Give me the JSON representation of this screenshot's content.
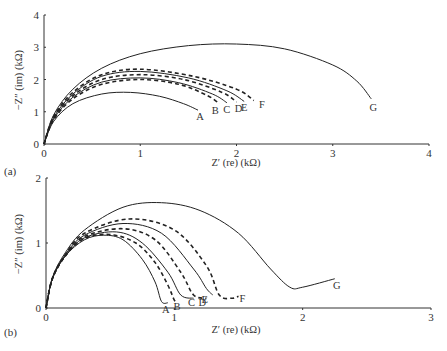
{
  "chart_data": [
    {
      "panel": "(a)",
      "type": "line",
      "title": "",
      "xlabel": "Z′ (re) (kΩ)",
      "ylabel": "−Z″ (im) (kΩ)",
      "xlim": [
        0,
        4
      ],
      "ylim": [
        0,
        4
      ],
      "xticks": [
        "0",
        "1",
        "2",
        "3",
        "4"
      ],
      "yticks": [
        "0",
        "1",
        "2",
        "3",
        "4"
      ],
      "grid": false,
      "legend": "inline curve labels",
      "series": [
        {
          "name": "A",
          "style": "solid",
          "x": [
            0,
            0.1,
            0.3,
            0.6,
            0.9,
            1.2,
            1.45,
            1.6
          ],
          "y": [
            0,
            0.7,
            1.25,
            1.55,
            1.6,
            1.48,
            1.25,
            1.05
          ]
        },
        {
          "name": "B",
          "style": "dashed",
          "x": [
            0,
            0.1,
            0.3,
            0.6,
            1.0,
            1.4,
            1.7,
            1.82
          ],
          "y": [
            0,
            0.75,
            1.4,
            1.85,
            2.0,
            1.85,
            1.5,
            1.25
          ]
        },
        {
          "name": "C",
          "style": "solid",
          "x": [
            0,
            0.1,
            0.3,
            0.6,
            1.0,
            1.4,
            1.75,
            1.9
          ],
          "y": [
            0,
            0.77,
            1.45,
            1.92,
            2.05,
            1.9,
            1.55,
            1.28
          ]
        },
        {
          "name": "D",
          "style": "dashed",
          "x": [
            0,
            0.1,
            0.3,
            0.6,
            1.0,
            1.45,
            1.85,
            2.0
          ],
          "y": [
            0,
            0.8,
            1.5,
            2.0,
            2.15,
            2.0,
            1.6,
            1.3
          ]
        },
        {
          "name": "E",
          "style": "solid",
          "x": [
            0,
            0.1,
            0.3,
            0.6,
            1.0,
            1.5,
            1.9,
            2.08
          ],
          "y": [
            0,
            0.82,
            1.55,
            2.1,
            2.25,
            2.05,
            1.65,
            1.32
          ]
        },
        {
          "name": "F",
          "style": "dashed",
          "x": [
            0,
            0.1,
            0.3,
            0.6,
            1.0,
            1.55,
            2.0,
            2.18
          ],
          "y": [
            0,
            0.85,
            1.6,
            2.15,
            2.32,
            2.1,
            1.7,
            1.35
          ]
        },
        {
          "name": "G",
          "style": "solid",
          "x": [
            0,
            0.1,
            0.3,
            0.6,
            1.0,
            1.5,
            2.0,
            2.5,
            3.0,
            3.25,
            3.4
          ],
          "y": [
            0,
            0.9,
            1.7,
            2.35,
            2.8,
            3.05,
            3.1,
            2.95,
            2.45,
            1.95,
            1.4
          ]
        }
      ]
    },
    {
      "panel": "(b)",
      "type": "line",
      "title": "",
      "xlabel": "Z′ (re) (kΩ)",
      "ylabel": "−Z″ (im) (kΩ)",
      "xlim": [
        0,
        3
      ],
      "ylim": [
        0,
        2
      ],
      "xticks": [
        "0",
        "1",
        "2",
        "3"
      ],
      "yticks": [
        "0",
        "1",
        "2"
      ],
      "grid": false,
      "legend": "inline curve labels",
      "series": [
        {
          "name": "A",
          "style": "solid",
          "x": [
            0,
            0.05,
            0.15,
            0.3,
            0.45,
            0.6,
            0.75,
            0.85,
            0.9,
            0.95
          ],
          "y": [
            0,
            0.45,
            0.8,
            1.05,
            1.12,
            1.05,
            0.75,
            0.4,
            0.1,
            0.08
          ]
        },
        {
          "name": "B",
          "style": "dashed",
          "x": [
            0,
            0.05,
            0.15,
            0.3,
            0.5,
            0.7,
            0.85,
            0.95,
            1.0,
            1.02
          ],
          "y": [
            0,
            0.45,
            0.8,
            1.07,
            1.13,
            1.0,
            0.7,
            0.35,
            0.12,
            0.1
          ]
        },
        {
          "name": "C",
          "style": "solid",
          "x": [
            0,
            0.05,
            0.15,
            0.3,
            0.55,
            0.75,
            0.95,
            1.05,
            1.15
          ],
          "y": [
            0,
            0.45,
            0.8,
            1.08,
            1.17,
            1.0,
            0.55,
            0.2,
            0.15
          ]
        },
        {
          "name": "D",
          "style": "dashed",
          "x": [
            0,
            0.05,
            0.15,
            0.3,
            0.6,
            0.85,
            1.05,
            1.15,
            1.25
          ],
          "y": [
            0,
            0.45,
            0.8,
            1.1,
            1.22,
            1.05,
            0.55,
            0.2,
            0.15
          ]
        },
        {
          "name": "E",
          "style": "solid",
          "x": [
            0,
            0.05,
            0.15,
            0.3,
            0.6,
            0.9,
            1.15,
            1.25,
            1.3
          ],
          "y": [
            0,
            0.46,
            0.82,
            1.12,
            1.3,
            1.15,
            0.6,
            0.3,
            0.2
          ]
        },
        {
          "name": "F",
          "style": "dashed",
          "x": [
            0,
            0.05,
            0.15,
            0.3,
            0.65,
            1.0,
            1.25,
            1.35,
            1.45,
            1.5
          ],
          "y": [
            0,
            0.46,
            0.82,
            1.15,
            1.37,
            1.2,
            0.65,
            0.2,
            0.15,
            0.18
          ]
        },
        {
          "name": "G",
          "style": "solid",
          "x": [
            0,
            0.05,
            0.15,
            0.3,
            0.6,
            0.9,
            1.2,
            1.5,
            1.75,
            1.9,
            2.0,
            2.25
          ],
          "y": [
            0,
            0.47,
            0.85,
            1.2,
            1.55,
            1.62,
            1.5,
            1.15,
            0.6,
            0.32,
            0.32,
            0.45
          ]
        }
      ]
    }
  ],
  "panels": {
    "a": {
      "label": "(a)"
    },
    "b": {
      "label": "(b)"
    }
  }
}
